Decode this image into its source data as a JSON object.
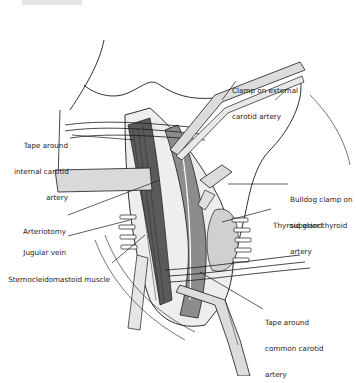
{
  "figure": {
    "labels": {
      "clamp_external": [
        "Clamp on external",
        "carotid artery"
      ],
      "tape_internal": [
        "Tape around",
        "internal carotid",
        "artery"
      ],
      "bulldog_clamp": [
        "Bulldog clamp on",
        "superior thyroid",
        "artery"
      ],
      "thyroid_gland": [
        "Thyroid gland"
      ],
      "arteriotomy": [
        "Arteriotomy"
      ],
      "jugular_vein": [
        "Jugular vein"
      ],
      "sternocleidomastoid": [
        "Sternocleidomastoid muscle"
      ],
      "tape_common": [
        "Tape around",
        "common carotid",
        "artery"
      ]
    },
    "colors": {
      "line": "#1a1a1a",
      "muscle_dark": "#5a5a5a",
      "artery_mid": "#8c8c8c",
      "tissue_light": "#cfcfcf",
      "instrument": "#d9d9d9",
      "background": "#ffffff"
    }
  }
}
